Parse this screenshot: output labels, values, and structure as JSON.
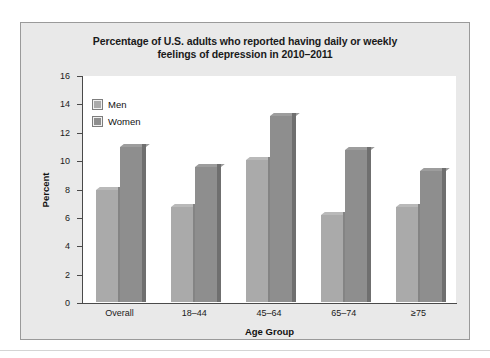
{
  "chart_data": {
    "type": "bar",
    "title": "Percentage of U.S. adults who reported having daily or weekly feelings of depression in 2010–2011",
    "title_line1": "Percentage of U.S. adults who reported having daily or weekly",
    "title_line2": "feelings of depression in 2010–2011",
    "xlabel": "Age Group",
    "ylabel": "Percent",
    "categories": [
      "Overall",
      "18–44",
      "45–64",
      "65–74",
      "≥75"
    ],
    "series": [
      {
        "name": "Men",
        "color": "#aaaaaa",
        "values": [
          7.9,
          6.7,
          10.0,
          6.1,
          6.7
        ]
      },
      {
        "name": "Women",
        "color": "#8e8e8e",
        "values": [
          10.9,
          9.5,
          13.1,
          10.7,
          9.2
        ]
      }
    ],
    "ylim": [
      0,
      16
    ],
    "yticks": [
      0,
      2,
      4,
      6,
      8,
      10,
      12,
      14,
      16
    ],
    "ytick_labels": [
      "0",
      "2",
      "4",
      "6",
      "8",
      "10",
      "12",
      "14",
      "16"
    ],
    "grid": false,
    "legend_position": "top-left",
    "legend": [
      "Men",
      "Women"
    ],
    "background": "#e9e9e9",
    "plot_background": "#ffffff"
  }
}
